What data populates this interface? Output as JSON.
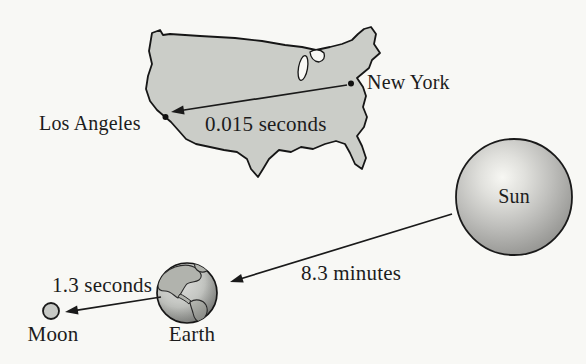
{
  "figure": {
    "background_color": "#f8f8f5",
    "ink_color": "#1a1a1a",
    "map": {
      "region": "United States",
      "fill_color": "#cbcdc8",
      "cities": [
        "Los Angeles",
        "New York"
      ]
    },
    "labels": {
      "los_angeles": "Los Angeles",
      "new_york": "New York",
      "sun": "Sun",
      "earth": "Earth",
      "moon": "Moon"
    },
    "light_travel_times": [
      {
        "from": "New York",
        "to": "Los Angeles",
        "label": "0.015 seconds"
      },
      {
        "from": "Sun",
        "to": "Earth",
        "label": "8.3 minutes"
      },
      {
        "from": "Earth",
        "to": "Moon",
        "label": "1.3 seconds"
      }
    ]
  }
}
